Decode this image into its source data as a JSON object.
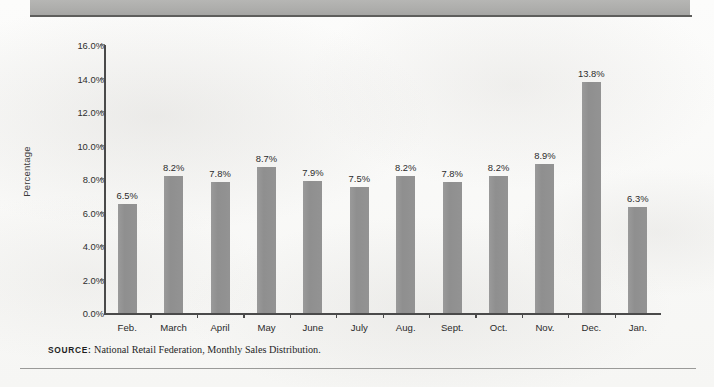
{
  "chart_data": {
    "type": "bar",
    "title": "",
    "subtitle": "",
    "xlabel": "",
    "ylabel": "Percentage",
    "categories": [
      "Feb.",
      "March",
      "April",
      "May",
      "June",
      "July",
      "Aug.",
      "Sept.",
      "Oct.",
      "Nov.",
      "Dec.",
      "Jan."
    ],
    "values": [
      6.5,
      8.2,
      7.8,
      8.7,
      7.9,
      7.5,
      8.2,
      7.8,
      8.2,
      8.9,
      13.8,
      6.3
    ],
    "value_labels": [
      "6.5%",
      "8.2%",
      "7.8%",
      "8.7%",
      "7.9%",
      "7.5%",
      "8.2%",
      "7.8%",
      "8.2%",
      "8.9%",
      "13.8%",
      "6.3%"
    ],
    "ylim": [
      0,
      16
    ],
    "ytick_values": [
      0,
      2,
      4,
      6,
      8,
      10,
      12,
      14,
      16
    ],
    "ytick_labels": [
      "0.0%",
      "2.0%",
      "4.0%",
      "6.0%",
      "8.0%",
      "10.0%",
      "12.0%",
      "14.0%",
      "16.0%"
    ],
    "grid": false,
    "legend": false,
    "bar_color": "#939393",
    "axis_color": "#4a4a4a"
  },
  "source": {
    "key": "SOURCE:",
    "text": "National Retail Federation, Monthly Sales Distribution."
  },
  "decor": {
    "header_band_color": "#aeaeac",
    "header_rule_color": "#5e5e5c",
    "footer_rule_color": "#9a9a98",
    "page_background": "#fbfbfa"
  }
}
